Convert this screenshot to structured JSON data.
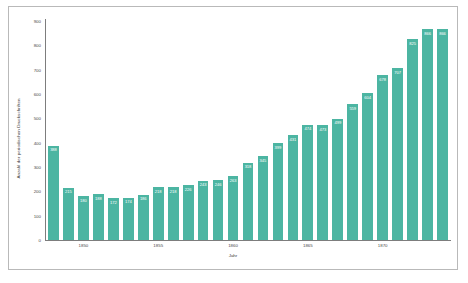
{
  "chart_data": {
    "type": "bar",
    "title": "",
    "xlabel": "Jahr",
    "ylabel": "Anzahl der periodischen Druckschriften",
    "ylim": [
      0,
      900
    ],
    "yticks": [
      0,
      100,
      200,
      300,
      400,
      500,
      600,
      700,
      800,
      900
    ],
    "xticks": [
      1850,
      1855,
      1860,
      1865,
      1870
    ],
    "grid": false,
    "legend": null,
    "bar_color": "#4cb5a2",
    "label_color": "#ffffff",
    "categories": [
      1848,
      1849,
      1850,
      1851,
      1852,
      1853,
      1854,
      1855,
      1856,
      1857,
      1858,
      1859,
      1860,
      1861,
      1862,
      1863,
      1864,
      1865,
      1866,
      1867,
      1868,
      1869,
      1870,
      1871,
      1872,
      1873,
      1874
    ],
    "values": [
      388,
      215,
      180,
      188,
      172,
      174,
      186,
      218,
      218,
      226,
      243,
      246,
      263,
      318,
      345,
      399,
      431,
      474,
      473,
      499,
      559,
      604,
      678,
      707,
      825,
      866,
      866
    ],
    "data_labels": [
      "388",
      "215",
      "180",
      "188",
      "172",
      "174",
      "186",
      "218",
      "218",
      "226",
      "243",
      "246",
      "263",
      "318",
      "345",
      "399",
      "431",
      "474",
      "473",
      "499",
      "559",
      "604",
      "678",
      "707",
      "825",
      "866",
      "866"
    ]
  }
}
